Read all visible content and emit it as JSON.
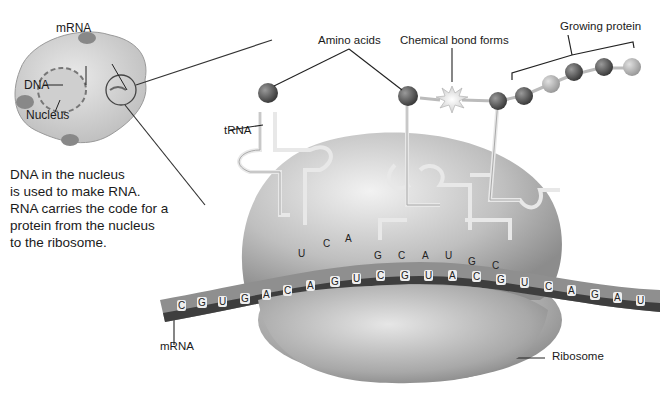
{
  "diagram": {
    "cell_inset": {
      "labels": {
        "mrna": "mRNA",
        "dna": "DNA",
        "nucleus": "Nucleus"
      }
    },
    "caption_lines": [
      "DNA in the nucleus",
      "is used to make RNA.",
      "RNA carries the code for a",
      "protein from the nucleus",
      "to the ribosome."
    ],
    "labels": {
      "amino_acids": "Amino acids",
      "chemical_bond": "Chemical bond forms",
      "growing_protein": "Growing protein",
      "trna": "tRNA",
      "mrna": "mRNA",
      "ribosome": "Ribosome"
    },
    "anticodons": [
      [
        "U",
        "C",
        "A"
      ],
      [
        "G",
        "C",
        "A"
      ],
      [
        "U",
        "G",
        "C"
      ]
    ],
    "mrna_sequence": [
      "C",
      "G",
      "U",
      "G",
      "A",
      "C",
      "A",
      "G",
      "U",
      "C",
      "G",
      "U",
      "A",
      "C",
      "G",
      "U",
      "C",
      "A",
      "G",
      "A",
      "U"
    ],
    "colors": {
      "ribosome": "#bdbdbd",
      "mrna_band": "#8a8a8a",
      "mrna_dark": "#3a3a3a",
      "amino_dark": "#555555",
      "amino_light": "#b5b5b5"
    }
  }
}
